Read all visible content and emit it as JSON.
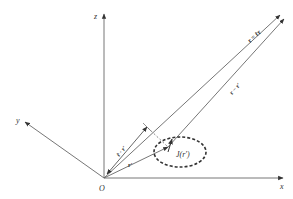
{
  "diagram": {
    "type": "vector-geometry",
    "colors": {
      "line": "#555555",
      "text": "#333333",
      "background": "#ffffff"
    },
    "axes": {
      "x_label": "x",
      "y_label": "y",
      "z_label": "z",
      "origin_label": "O"
    },
    "vectors": {
      "r_label": "r = r̂r",
      "r_minus_rprime_label": "r − r′",
      "rprime_label": "r′",
      "projection_label": "r̂ · r′"
    },
    "source": {
      "label": "J(r′)"
    }
  }
}
